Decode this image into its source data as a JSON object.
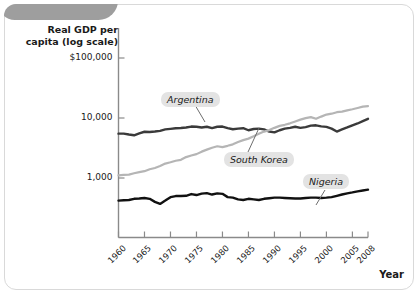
{
  "figure": {
    "y_axis_title": "Real GDP per\ncapita (log scale)",
    "y_axis_title_line1": "Real GDP per",
    "y_axis_title_line2": "capita (log scale)",
    "x_axis_title": "Year"
  },
  "colors": {
    "argentina": "#3a3a3a",
    "south_korea": "#b5b5b5",
    "nigeria": "#111111",
    "axis": "#8a8a8a",
    "label_box": "#e3e3e3",
    "frame": "#d9d9d9",
    "deco_band": "#9e9e9e"
  },
  "labels": {
    "argentina": "Argentina",
    "south_korea": "South Korea",
    "nigeria": "Nigeria"
  },
  "chart_data": {
    "type": "line",
    "title": "",
    "subtitle": "",
    "xlabel": "Year",
    "ylabel": "Real GDP per capita (log scale)",
    "y_scale": "log",
    "ylim": [
      300,
      100000
    ],
    "xlim": [
      1960,
      2008
    ],
    "grid": false,
    "legend": "inline-callout-labels",
    "ytick_labels": [
      "$100,000",
      "10,000",
      "1,000"
    ],
    "ytick_values": [
      100000,
      10000,
      1000
    ],
    "xtick_labels": [
      "1960",
      "1965",
      "1970",
      "1975",
      "1980",
      "1985",
      "1990",
      "1995",
      "2000",
      "2005",
      "2008"
    ],
    "xtick_values": [
      1960,
      1965,
      1970,
      1975,
      1980,
      1985,
      1990,
      1995,
      2000,
      2005,
      2008
    ],
    "x": [
      1960,
      1961,
      1962,
      1963,
      1964,
      1965,
      1966,
      1967,
      1968,
      1969,
      1970,
      1971,
      1972,
      1973,
      1974,
      1975,
      1976,
      1977,
      1978,
      1979,
      1980,
      1981,
      1982,
      1983,
      1984,
      1985,
      1986,
      1987,
      1988,
      1989,
      1990,
      1991,
      1992,
      1993,
      1994,
      1995,
      1996,
      1997,
      1998,
      1999,
      2000,
      2001,
      2002,
      2003,
      2004,
      2005,
      2006,
      2007,
      2008
    ],
    "series": [
      {
        "name": "Argentina",
        "color": "#3a3a3a",
        "values": [
          5480,
          5500,
          5300,
          5150,
          5550,
          5900,
          5850,
          5950,
          6100,
          6450,
          6600,
          6750,
          6800,
          6950,
          7200,
          7150,
          6950,
          7150,
          6800,
          7150,
          7200,
          6800,
          6500,
          6650,
          6750,
          6250,
          6550,
          6650,
          6450,
          5950,
          5750,
          6250,
          6650,
          6850,
          7150,
          6850,
          7050,
          7450,
          7550,
          7250,
          7100,
          6650,
          5950,
          6450,
          6950,
          7550,
          8100,
          8850,
          9700
        ],
        "style": "solid"
      },
      {
        "name": "South Korea",
        "color": "#b5b5b5",
        "values": [
          1110,
          1130,
          1140,
          1200,
          1250,
          1300,
          1400,
          1470,
          1580,
          1740,
          1830,
          1940,
          2010,
          2230,
          2370,
          2500,
          2750,
          2970,
          3200,
          3380,
          3270,
          3440,
          3640,
          3980,
          4280,
          4530,
          4950,
          5440,
          5940,
          6290,
          6850,
          7400,
          7700,
          8150,
          8750,
          9400,
          9950,
          10350,
          9700,
          10550,
          11400,
          11800,
          12500,
          12800,
          13400,
          14000,
          14700,
          15450,
          15800
        ],
        "style": "solid"
      },
      {
        "name": "Nigeria",
        "color": "#111111",
        "values": [
          420,
          425,
          430,
          450,
          455,
          465,
          450,
          400,
          370,
          420,
          480,
          500,
          500,
          505,
          540,
          520,
          550,
          560,
          530,
          555,
          545,
          480,
          470,
          440,
          430,
          450,
          440,
          430,
          450,
          460,
          470,
          470,
          465,
          460,
          455,
          455,
          465,
          470,
          470,
          465,
          470,
          480,
          505,
          530,
          555,
          575,
          600,
          620,
          640
        ],
        "style": "solid"
      }
    ],
    "annotations": [
      {
        "text": "Argentina",
        "type": "callout",
        "points_to_year": 1977
      },
      {
        "text": "South Korea",
        "type": "callout",
        "points_to_year": 1989
      },
      {
        "text": "Nigeria",
        "type": "callout",
        "points_to_year": 1996
      }
    ]
  }
}
